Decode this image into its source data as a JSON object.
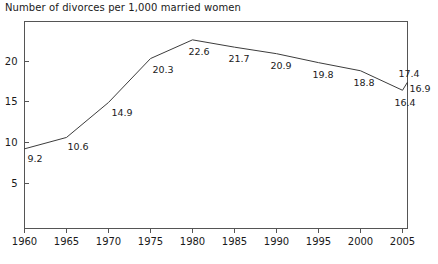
{
  "chart_data": {
    "type": "line",
    "title": "Number of divorces per 1,000 married women",
    "xlabel": "",
    "ylabel": "",
    "x": [
      1960,
      1965,
      1970,
      1975,
      1980,
      1985,
      1990,
      1995,
      2000,
      2005,
      2007,
      2008
    ],
    "values": [
      9.2,
      10.6,
      14.9,
      20.3,
      22.6,
      21.7,
      20.9,
      19.8,
      18.8,
      16.4,
      17.4,
      16.9
    ],
    "point_labels": [
      "9.2",
      "10.6",
      "14.9",
      "20.3",
      "22.6",
      "21.7",
      "20.9",
      "19.8",
      "18.8",
      "16.4",
      "17.4",
      "16.9"
    ],
    "xticks": [
      "1960",
      "1965",
      "1970",
      "1975",
      "1980",
      "1985",
      "1990",
      "1995",
      "2000",
      "2005"
    ],
    "xtick_values": [
      1960,
      1965,
      1970,
      1975,
      1980,
      1985,
      1990,
      1995,
      2000,
      2005
    ],
    "yticks": [
      "5",
      "10",
      "15",
      "20"
    ],
    "ytick_values": [
      5,
      10,
      15,
      20
    ],
    "xlim": [
      1960,
      2008
    ],
    "ylim": [
      0,
      24.6
    ],
    "grid": false,
    "legend": "none",
    "line_color": "#3c3c3c",
    "axis_color": "#555555",
    "text_color": "#1a1a1a",
    "background": "#ffffff"
  }
}
